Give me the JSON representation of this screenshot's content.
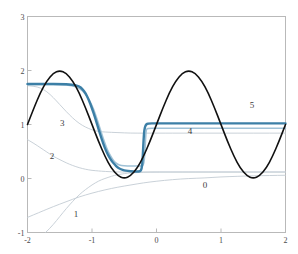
{
  "chart_data": {
    "type": "line",
    "title": "",
    "subtitle": "",
    "xlabel": "",
    "ylabel": "",
    "xlim": [
      -2,
      2
    ],
    "ylim": [
      -1,
      3
    ],
    "xticks": [
      -2,
      -1,
      0,
      1,
      2
    ],
    "yticks": [
      -1,
      0,
      1,
      2,
      3
    ],
    "xtick_labels": [
      "-2",
      "-1",
      "0",
      "1",
      "2"
    ],
    "ytick_labels": [
      "-1",
      "0",
      "1",
      "2",
      "3"
    ],
    "grid": false,
    "legend": "inline-curve-labels",
    "annotations": [
      {
        "text": "0",
        "x": 0.75,
        "y": -0.17
      },
      {
        "text": "1",
        "x": -1.25,
        "y": -0.72
      },
      {
        "text": "2",
        "x": -1.62,
        "y": 0.37
      },
      {
        "text": "3",
        "x": -1.46,
        "y": 0.97
      },
      {
        "text": "4",
        "x": 0.52,
        "y": 0.82
      },
      {
        "text": "5",
        "x": 1.48,
        "y": 1.3
      }
    ],
    "series": [
      {
        "name": "target",
        "label": "",
        "color": "#111111",
        "width": 1.6,
        "description": "black reference curve: sine-like wave with plateau near x in [-0.8,-0.2]",
        "points": [
          [
            -2.0,
            1.0
          ],
          [
            -1.9,
            1.31
          ],
          [
            -1.8,
            1.59
          ],
          [
            -1.7,
            1.81
          ],
          [
            -1.6,
            1.95
          ],
          [
            -1.5,
            2.0
          ],
          [
            -1.4,
            1.95
          ],
          [
            -1.3,
            1.81
          ],
          [
            -1.2,
            1.59
          ],
          [
            -1.1,
            1.31
          ],
          [
            -1.0,
            1.0
          ],
          [
            -0.9,
            0.69
          ],
          [
            -0.8,
            0.41
          ],
          [
            -0.7,
            0.19
          ],
          [
            -0.6,
            0.05
          ],
          [
            -0.5,
            0.0
          ],
          [
            -0.4,
            0.05
          ],
          [
            -0.3,
            0.19
          ],
          [
            -0.2,
            0.41
          ],
          [
            -0.1,
            0.69
          ],
          [
            0.0,
            1.0
          ],
          [
            0.1,
            1.31
          ],
          [
            0.2,
            1.59
          ],
          [
            0.3,
            1.81
          ],
          [
            0.4,
            1.95
          ],
          [
            0.5,
            2.0
          ],
          [
            0.6,
            1.95
          ],
          [
            0.7,
            1.81
          ],
          [
            0.8,
            1.59
          ],
          [
            0.9,
            1.31
          ],
          [
            1.0,
            1.0
          ],
          [
            1.1,
            0.69
          ],
          [
            1.2,
            0.41
          ],
          [
            1.3,
            0.19
          ],
          [
            1.4,
            0.05
          ],
          [
            1.5,
            0.0
          ],
          [
            1.6,
            0.05
          ],
          [
            1.7,
            0.19
          ],
          [
            1.8,
            0.41
          ],
          [
            1.9,
            0.69
          ],
          [
            2.0,
            1.0
          ]
        ]
      },
      {
        "name": "approx-0",
        "label": "0",
        "color": "#c3ccd4",
        "width": 0.9,
        "description": "iteration 0: slow sigmoid rising from -0.72 to about 0.06",
        "points": [
          [
            -2.0,
            -0.72
          ],
          [
            -1.8,
            -0.62
          ],
          [
            -1.6,
            -0.52
          ],
          [
            -1.4,
            -0.43
          ],
          [
            -1.2,
            -0.34
          ],
          [
            -1.0,
            -0.27
          ],
          [
            -0.8,
            -0.21
          ],
          [
            -0.6,
            -0.16
          ],
          [
            -0.4,
            -0.12
          ],
          [
            -0.2,
            -0.08
          ],
          [
            0.0,
            -0.05
          ],
          [
            0.25,
            -0.02
          ],
          [
            0.5,
            0.0
          ],
          [
            0.75,
            0.01
          ],
          [
            1.0,
            0.03
          ],
          [
            1.25,
            0.04
          ],
          [
            1.5,
            0.05
          ],
          [
            1.75,
            0.055
          ],
          [
            2.0,
            0.06
          ]
        ]
      },
      {
        "name": "approx-1",
        "label": "1",
        "color": "#c3ccd4",
        "width": 0.9,
        "description": "iteration 1: steep rise from below -1 up to a plateau near 0.12",
        "points": [
          [
            -1.72,
            -1.0
          ],
          [
            -1.65,
            -0.92
          ],
          [
            -1.55,
            -0.78
          ],
          [
            -1.45,
            -0.63
          ],
          [
            -1.35,
            -0.49
          ],
          [
            -1.25,
            -0.36
          ],
          [
            -1.15,
            -0.25
          ],
          [
            -1.05,
            -0.16
          ],
          [
            -0.95,
            -0.08
          ],
          [
            -0.85,
            -0.02
          ],
          [
            -0.75,
            0.02
          ],
          [
            -0.65,
            0.06
          ],
          [
            -0.55,
            0.08
          ],
          [
            -0.45,
            0.1
          ],
          [
            -0.3,
            0.11
          ],
          [
            -0.1,
            0.12
          ],
          [
            0.2,
            0.12
          ],
          [
            0.6,
            0.12
          ],
          [
            1.0,
            0.12
          ],
          [
            1.5,
            0.12
          ],
          [
            2.0,
            0.12
          ]
        ]
      },
      {
        "name": "approx-2",
        "label": "2",
        "color": "#c3ccd4",
        "width": 0.9,
        "description": "iteration 2: decays from 0.72 at left to a flat level near 0.12",
        "points": [
          [
            -2.0,
            0.72
          ],
          [
            -1.9,
            0.65
          ],
          [
            -1.8,
            0.57
          ],
          [
            -1.7,
            0.49
          ],
          [
            -1.6,
            0.41
          ],
          [
            -1.5,
            0.35
          ],
          [
            -1.4,
            0.29
          ],
          [
            -1.3,
            0.24
          ],
          [
            -1.2,
            0.2
          ],
          [
            -1.1,
            0.17
          ],
          [
            -1.0,
            0.15
          ],
          [
            -0.9,
            0.14
          ],
          [
            -0.8,
            0.13
          ],
          [
            -0.6,
            0.12
          ],
          [
            -0.4,
            0.12
          ],
          [
            -0.2,
            0.12
          ],
          [
            0.0,
            0.12
          ],
          [
            0.5,
            0.12
          ],
          [
            1.0,
            0.12
          ],
          [
            1.5,
            0.12
          ],
          [
            2.0,
            0.12
          ]
        ]
      },
      {
        "name": "approx-3",
        "label": "3",
        "color": "#c3ccd4",
        "width": 0.9,
        "description": "iteration 3: decays from 1.72 at left to a flat level near 0.84",
        "points": [
          [
            -2.0,
            1.72
          ],
          [
            -1.9,
            1.71
          ],
          [
            -1.8,
            1.68
          ],
          [
            -1.7,
            1.61
          ],
          [
            -1.6,
            1.5
          ],
          [
            -1.5,
            1.37
          ],
          [
            -1.4,
            1.24
          ],
          [
            -1.3,
            1.12
          ],
          [
            -1.2,
            1.02
          ],
          [
            -1.1,
            0.95
          ],
          [
            -1.0,
            0.9
          ],
          [
            -0.9,
            0.87
          ],
          [
            -0.8,
            0.86
          ],
          [
            -0.6,
            0.85
          ],
          [
            -0.4,
            0.84
          ],
          [
            -0.2,
            0.84
          ],
          [
            0.0,
            0.84
          ],
          [
            0.5,
            0.84
          ],
          [
            1.0,
            0.84
          ],
          [
            1.5,
            0.84
          ],
          [
            2.0,
            0.84
          ]
        ]
      },
      {
        "name": "approx-4",
        "label": "4",
        "color": "#9fc1d6",
        "width": 1.5,
        "description": "iteration 4: plateau 1.74 then drop to 0.22, sharp step up to 0.93",
        "points": [
          [
            -2.0,
            1.74
          ],
          [
            -1.7,
            1.74
          ],
          [
            -1.5,
            1.74
          ],
          [
            -1.3,
            1.72
          ],
          [
            -1.2,
            1.68
          ],
          [
            -1.1,
            1.57
          ],
          [
            -1.0,
            1.36
          ],
          [
            -0.95,
            1.2
          ],
          [
            -0.9,
            1.02
          ],
          [
            -0.85,
            0.83
          ],
          [
            -0.8,
            0.65
          ],
          [
            -0.75,
            0.5
          ],
          [
            -0.7,
            0.39
          ],
          [
            -0.65,
            0.31
          ],
          [
            -0.6,
            0.26
          ],
          [
            -0.55,
            0.24
          ],
          [
            -0.45,
            0.23
          ],
          [
            -0.35,
            0.23
          ],
          [
            -0.25,
            0.23
          ],
          [
            -0.2,
            0.23
          ],
          [
            -0.18,
            0.45
          ],
          [
            -0.17,
            0.72
          ],
          [
            -0.16,
            0.9
          ],
          [
            -0.14,
            0.93
          ],
          [
            0.0,
            0.93
          ],
          [
            0.5,
            0.93
          ],
          [
            1.0,
            0.93
          ],
          [
            1.5,
            0.93
          ],
          [
            2.0,
            0.93
          ]
        ]
      },
      {
        "name": "approx-5",
        "label": "5",
        "color": "#3c7fa6",
        "width": 2.4,
        "description": "iteration 5: thick blue, plateau 1.75 then follows target down to 0.12, step up to 1.02",
        "points": [
          [
            -2.0,
            1.75
          ],
          [
            -1.7,
            1.75
          ],
          [
            -1.5,
            1.75
          ],
          [
            -1.3,
            1.74
          ],
          [
            -1.2,
            1.71
          ],
          [
            -1.15,
            1.66
          ],
          [
            -1.1,
            1.58
          ],
          [
            -1.05,
            1.46
          ],
          [
            -1.0,
            1.3
          ],
          [
            -0.95,
            1.12
          ],
          [
            -0.9,
            0.92
          ],
          [
            -0.85,
            0.73
          ],
          [
            -0.8,
            0.56
          ],
          [
            -0.75,
            0.43
          ],
          [
            -0.7,
            0.33
          ],
          [
            -0.65,
            0.26
          ],
          [
            -0.6,
            0.2
          ],
          [
            -0.55,
            0.17
          ],
          [
            -0.5,
            0.15
          ],
          [
            -0.45,
            0.14
          ],
          [
            -0.35,
            0.13
          ],
          [
            -0.28,
            0.13
          ],
          [
            -0.24,
            0.14
          ],
          [
            -0.22,
            0.25
          ],
          [
            -0.21,
            0.48
          ],
          [
            -0.2,
            0.72
          ],
          [
            -0.19,
            0.9
          ],
          [
            -0.17,
            0.99
          ],
          [
            -0.14,
            1.02
          ],
          [
            0.0,
            1.02
          ],
          [
            0.4,
            1.02
          ],
          [
            0.9,
            1.02
          ],
          [
            1.4,
            1.02
          ],
          [
            1.8,
            1.02
          ],
          [
            2.0,
            1.02
          ]
        ]
      }
    ]
  }
}
